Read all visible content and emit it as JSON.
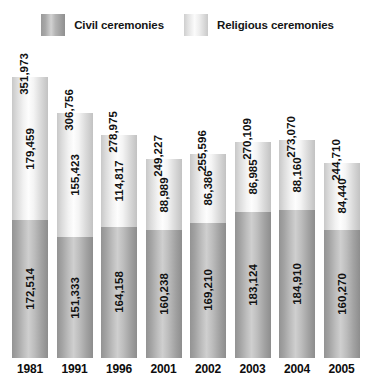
{
  "legend": {
    "items": [
      {
        "label": "Civil ceremonies",
        "swatch": "civil-swatch",
        "color": "#b4b4b4"
      },
      {
        "label": "Religious ceremonies",
        "swatch": "religious-swatch",
        "color": "#f2f2f2"
      }
    ]
  },
  "chart_data": {
    "type": "bar",
    "subtype": "stacked",
    "title": "",
    "xlabel": "",
    "ylabel": "",
    "categories": [
      "1981",
      "1991",
      "1996",
      "2001",
      "2002",
      "2003",
      "2004",
      "2005"
    ],
    "series": [
      {
        "name": "Civil ceremonies",
        "color": "#b4b4b4",
        "values": [
          172514,
          151333,
          164158,
          160238,
          169210,
          183124,
          184910,
          160270
        ],
        "labels": [
          "172,514",
          "151,333",
          "164,158",
          "160,238",
          "169,210",
          "183,124",
          "184,910",
          "160,270"
        ]
      },
      {
        "name": "Religious ceremonies",
        "color": "#f2f2f2",
        "values": [
          179459,
          155423,
          114817,
          88989,
          86386,
          86985,
          88160,
          84440
        ],
        "labels": [
          "179,459",
          "155,423",
          "114,817",
          "88,989",
          "86,386",
          "86,985",
          "88,160",
          "84,440"
        ]
      }
    ],
    "totals": [
      351973,
      306756,
      278975,
      249227,
      255596,
      270109,
      273070,
      244710
    ],
    "total_labels": [
      "351,973",
      "306,756",
      "278,975",
      "249,227",
      "255,596",
      "270,109",
      "273,070",
      "244,710"
    ],
    "ylim": [
      0,
      360000
    ],
    "grid": false,
    "legend_position": "top"
  }
}
